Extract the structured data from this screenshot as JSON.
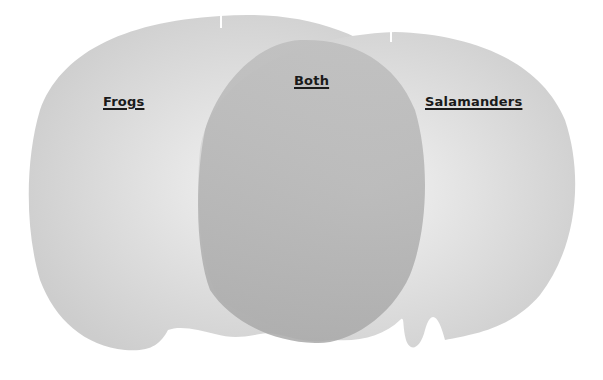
{
  "diagram": {
    "type": "venn",
    "sets": [
      {
        "id": "left",
        "label": "Frogs"
      },
      {
        "id": "right",
        "label": "Salamanders"
      }
    ],
    "intersection": {
      "label": "Both"
    }
  },
  "colors": {
    "background": "#ffffff",
    "left_fill": "#d4d4d4",
    "right_fill": "#d8d8d8",
    "overlap_fill": "#b0b0b0",
    "label_text": "#1a1a1a"
  }
}
